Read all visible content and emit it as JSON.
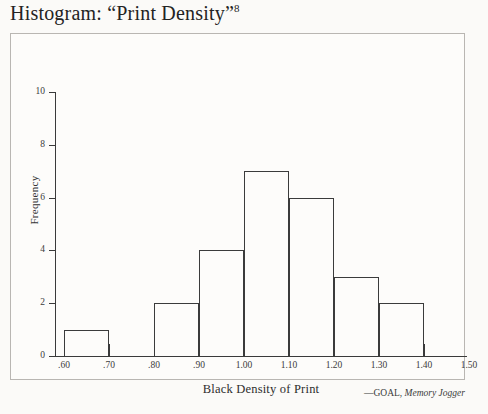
{
  "figure": {
    "title_prefix": "Histogram: “Print Density”",
    "title_footnote": "8",
    "attribution_author": "—GOAL,",
    "attribution_source": "Memory Jogger"
  },
  "chart_data": {
    "type": "bar",
    "title": "Histogram: “Print Density”8",
    "xlabel": "Black Density of Print",
    "ylabel": "Frequency",
    "xlim": [
      0.5,
      1.5
    ],
    "ylim": [
      0,
      10
    ],
    "grid": false,
    "legend": null,
    "bin_width": 0.1,
    "bin_edges": [
      0.6,
      0.7,
      0.8,
      0.9,
      1.0,
      1.1,
      1.2,
      1.3,
      1.4
    ],
    "categories": [
      ".60-.70",
      ".70-.80",
      ".80-.90",
      ".90-1.00",
      "1.00-1.10",
      "1.10-1.20",
      "1.20-1.30",
      "1.30-1.40"
    ],
    "values": [
      1,
      0,
      2,
      4,
      7,
      6,
      3,
      2
    ],
    "bars": [
      {
        "left": 0.6,
        "right": 0.7,
        "value": 1
      },
      {
        "left": 0.7,
        "right": 0.8,
        "value": 0
      },
      {
        "left": 0.8,
        "right": 0.9,
        "value": 2
      },
      {
        "left": 0.9,
        "right": 1.0,
        "value": 4
      },
      {
        "left": 1.0,
        "right": 1.1,
        "value": 7
      },
      {
        "left": 1.1,
        "right": 1.2,
        "value": 6
      },
      {
        "left": 1.2,
        "right": 1.3,
        "value": 3
      },
      {
        "left": 1.3,
        "right": 1.4,
        "value": 2
      }
    ],
    "xticks": [
      0.6,
      0.7,
      0.8,
      0.9,
      1.0,
      1.1,
      1.2,
      1.3,
      1.4,
      1.5
    ],
    "xticklabels": [
      ".60",
      ".70",
      ".80",
      ".90",
      "1.00",
      "1.10",
      "1.20",
      "1.30",
      "1.40",
      "1.50"
    ],
    "yticks": [
      0,
      2,
      4,
      6,
      8,
      10
    ],
    "yticklabels": [
      "0",
      "2",
      "4",
      "6",
      "8",
      "10"
    ],
    "total_count": 25,
    "colors": {
      "bar_outline": "#3b3b3b",
      "bar_fill": "transparent",
      "axis": "#3a3a3a",
      "frame": "#b9b6b2",
      "background": "#fbfaf8",
      "text": "#2a2a2a"
    }
  }
}
